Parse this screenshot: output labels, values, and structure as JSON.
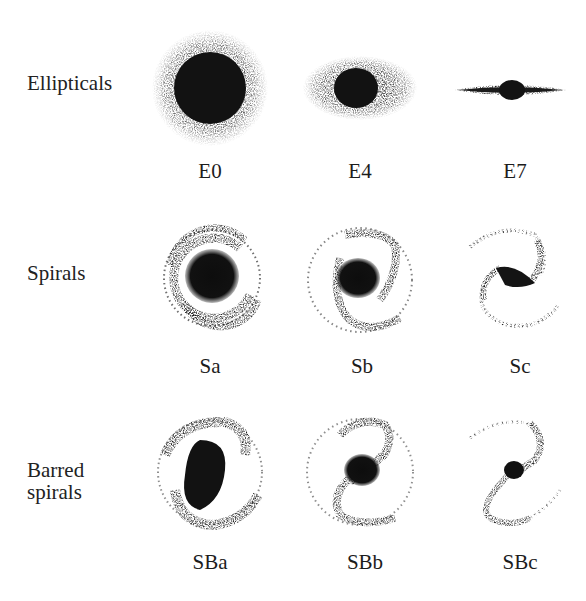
{
  "figure": {
    "rows": [
      {
        "label": "Ellipticals",
        "label_lines": [
          "Ellipticals"
        ],
        "types": [
          {
            "code": "E0",
            "shape": "elliptical",
            "axis_ratio": 1.0
          },
          {
            "code": "E4",
            "shape": "elliptical",
            "axis_ratio": 0.6
          },
          {
            "code": "E7",
            "shape": "elliptical",
            "axis_ratio": 0.3
          }
        ]
      },
      {
        "label": "Spirals",
        "label_lines": [
          "Spirals"
        ],
        "types": [
          {
            "code": "Sa",
            "shape": "spiral",
            "bulge": "large",
            "arms": "tightly wound"
          },
          {
            "code": "Sb",
            "shape": "spiral",
            "bulge": "medium",
            "arms": "moderately wound"
          },
          {
            "code": "Sc",
            "shape": "spiral",
            "bulge": "small",
            "arms": "loosely wound"
          }
        ]
      },
      {
        "label": "Barred spirals",
        "label_lines": [
          "Barred",
          "spirals"
        ],
        "types": [
          {
            "code": "SBa",
            "shape": "barred-spiral",
            "bulge": "large"
          },
          {
            "code": "SBb",
            "shape": "barred-spiral",
            "bulge": "medium"
          },
          {
            "code": "SBc",
            "shape": "barred-spiral",
            "bulge": "small"
          }
        ]
      }
    ]
  },
  "colors": {
    "background": "#ffffff",
    "ink": "#1a1a1a"
  }
}
